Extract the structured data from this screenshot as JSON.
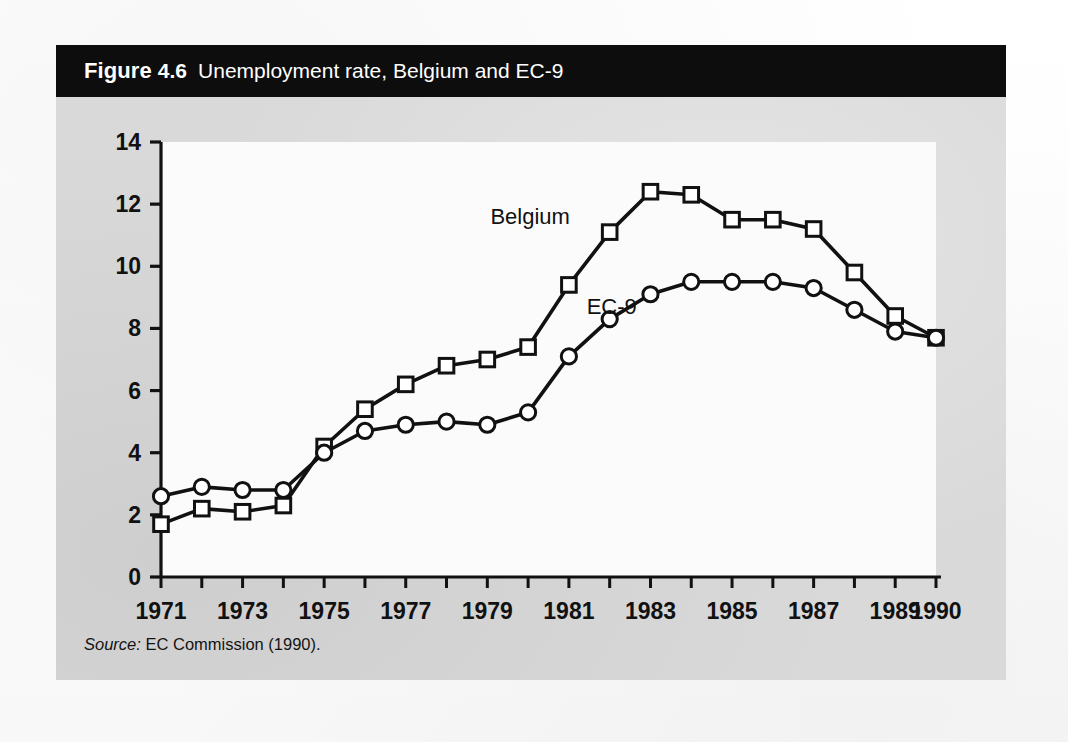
{
  "figure": {
    "label": "Figure",
    "number": "4.6",
    "caption": "Unemployment rate, Belgium and EC-9",
    "source_label": "Source:",
    "source_text": " EC Commission (1990)."
  },
  "colors": {
    "title_bar_bg": "#0d0d0d",
    "title_text": "#ffffff",
    "card_bg": "#d9d9d9",
    "plot_bg": "#fbfbfb",
    "axis": "#111111",
    "series_line": "#111111",
    "marker_fill": "#ffffff"
  },
  "chart_data": {
    "type": "line",
    "title": "Unemployment rate, Belgium and EC-9",
    "xlabel": "",
    "ylabel": "",
    "xlim": [
      1971,
      1990
    ],
    "ylim": [
      0,
      14
    ],
    "ytick_step": 2,
    "yticks": [
      "0",
      "2",
      "4",
      "6",
      "8",
      "10",
      "12",
      "14"
    ],
    "x": [
      1971,
      1972,
      1973,
      1974,
      1975,
      1976,
      1977,
      1978,
      1979,
      1980,
      1981,
      1982,
      1983,
      1984,
      1985,
      1986,
      1987,
      1988,
      1989,
      1990
    ],
    "xtick_labels": [
      "1971",
      "1973",
      "1975",
      "1977",
      "1979",
      "1981",
      "1983",
      "1985",
      "1987",
      "1989",
      "1990"
    ],
    "xtick_values": [
      1971,
      1973,
      1975,
      1977,
      1979,
      1981,
      1983,
      1985,
      1987,
      1989,
      1990
    ],
    "grid": false,
    "legend": "inline-annotations",
    "series": [
      {
        "name": "Belgium",
        "marker": "square",
        "label_x": 1980.05,
        "label_y": 11.35,
        "values": [
          1.7,
          2.2,
          2.1,
          2.3,
          4.2,
          5.4,
          6.2,
          6.8,
          7.0,
          7.4,
          9.4,
          11.1,
          12.4,
          12.3,
          11.5,
          11.5,
          11.2,
          9.8,
          8.4,
          7.7
        ]
      },
      {
        "name": "EC-9",
        "marker": "circle",
        "label_x": 1982.05,
        "label_y": 8.45,
        "values": [
          2.6,
          2.9,
          2.8,
          2.8,
          4.0,
          4.7,
          4.9,
          5.0,
          4.9,
          5.3,
          7.1,
          8.3,
          9.1,
          9.5,
          9.5,
          9.5,
          9.3,
          8.6,
          7.9,
          7.7
        ]
      }
    ]
  }
}
